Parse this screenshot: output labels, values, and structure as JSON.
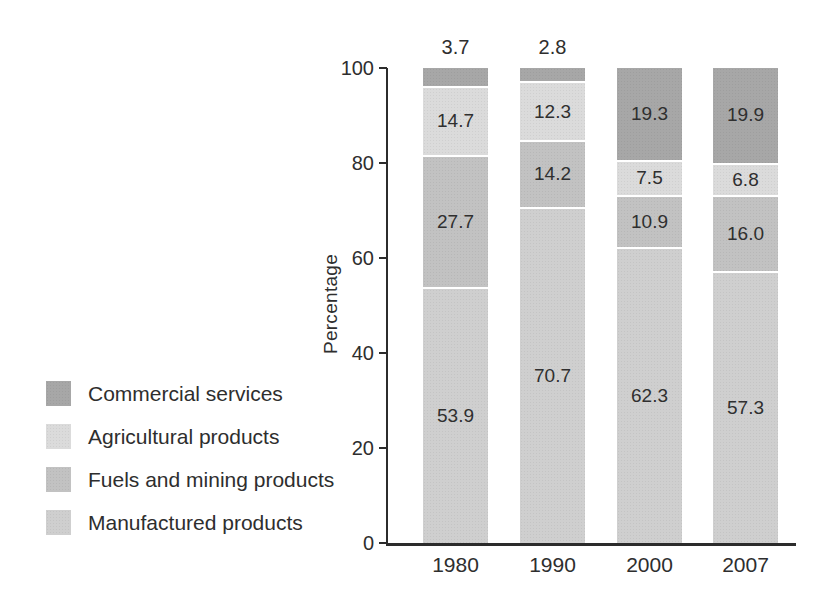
{
  "chart_data": {
    "type": "bar",
    "stacked": true,
    "title": "",
    "ylabel": "Percentage",
    "xlabel": "",
    "ylim": [
      0,
      100
    ],
    "yticks": [
      0,
      20,
      40,
      60,
      80,
      100
    ],
    "grid": false,
    "categories": [
      "1980",
      "1990",
      "2000",
      "2007"
    ],
    "series": [
      {
        "name": "Manufactured products",
        "color": "#cfcfcf",
        "values": [
          53.9,
          70.7,
          62.3,
          57.3
        ],
        "labels": [
          "53.9",
          "70.7",
          "62.3",
          "57.3"
        ],
        "label_placement": [
          "inside",
          "inside",
          "inside",
          "inside"
        ]
      },
      {
        "name": "Fuels and mining products",
        "color": "#c2c2c2",
        "values": [
          27.7,
          14.2,
          10.9,
          16.0
        ],
        "labels": [
          "27.7",
          "14.2",
          "10.9",
          "16.0"
        ],
        "label_placement": [
          "inside",
          "inside",
          "inside",
          "inside"
        ]
      },
      {
        "name": "Agricultural products",
        "color": "#dbdbdb",
        "values": [
          14.7,
          12.3,
          7.5,
          6.8
        ],
        "labels": [
          "14.7",
          "12.3",
          "7.5",
          "6.8"
        ],
        "label_placement": [
          "inside",
          "inside",
          "inside",
          "inside"
        ]
      },
      {
        "name": "Commercial services",
        "color": "#a7a7a7",
        "values": [
          3.7,
          2.8,
          19.3,
          19.9
        ],
        "labels": [
          "3.7",
          "2.8",
          "19.3",
          "19.9"
        ],
        "label_placement": [
          "above",
          "above",
          "inside",
          "inside"
        ]
      }
    ],
    "legend": {
      "position": "bottom-left",
      "items": [
        "Commercial services",
        "Agricultural products",
        "Fuels and mining products",
        "Manufactured products"
      ]
    },
    "text_color": "#2e2e2e",
    "axis_color": "#2c2c2c",
    "separator_color": "#ffffff",
    "background_color": "#ffffff"
  }
}
